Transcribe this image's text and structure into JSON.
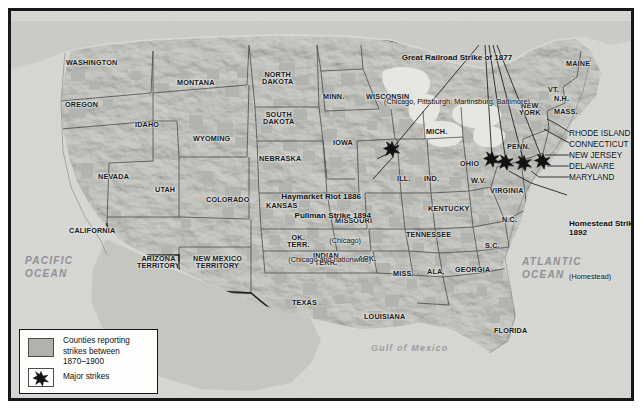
{
  "map": {
    "title_hidden": "",
    "background_color": "#d8d8d4",
    "county_shade_color": "#b0b2ae",
    "border_color": "#16181a",
    "ocean_label_color": "#8e9196"
  },
  "water_labels": [
    {
      "name": "pacific-ocean",
      "text": "PACIFIC\nOCEAN",
      "x": 22,
      "y": 252
    },
    {
      "name": "atlantic-ocean",
      "text": "ATLANTIC\nOCEAN",
      "x": 519,
      "y": 253
    },
    {
      "name": "gulf-of-mexico",
      "text": "Gulf of Mexico",
      "x": 368,
      "y": 340
    }
  ],
  "states": [
    {
      "name": "washington",
      "text": "WASHINGTON",
      "x": 63,
      "y": 56
    },
    {
      "name": "oregon",
      "text": "OREGON",
      "x": 62,
      "y": 98
    },
    {
      "name": "idaho",
      "text": "IDAHO",
      "x": 132,
      "y": 118
    },
    {
      "name": "montana",
      "text": "MONTANA",
      "x": 174,
      "y": 76
    },
    {
      "name": "wyoming",
      "text": "WYOMING",
      "x": 190,
      "y": 132
    },
    {
      "name": "nevada",
      "text": "NEVADA",
      "x": 95,
      "y": 170
    },
    {
      "name": "utah",
      "text": "UTAH",
      "x": 152,
      "y": 183
    },
    {
      "name": "colorado",
      "text": "COLORADO",
      "x": 203,
      "y": 193
    },
    {
      "name": "california",
      "text": "CALIFORNIA",
      "x": 66,
      "y": 224
    },
    {
      "name": "arizona-territory",
      "text": "ARIZONA\nTERRITORY",
      "x": 134,
      "y": 252
    },
    {
      "name": "new-mexico-territory",
      "text": "NEW MEXICO\nTERRITORY",
      "x": 190,
      "y": 252
    },
    {
      "name": "north-dakota",
      "text": "NORTH\nDAKOTA",
      "x": 259,
      "y": 68
    },
    {
      "name": "south-dakota",
      "text": "SOUTH\nDAKOTA",
      "x": 260,
      "y": 108
    },
    {
      "name": "nebraska",
      "text": "NEBRASKA",
      "x": 256,
      "y": 152
    },
    {
      "name": "kansas",
      "text": "KANSAS",
      "x": 263,
      "y": 199
    },
    {
      "name": "oklahoma-territory",
      "text": "OK.\nTERR.",
      "x": 284,
      "y": 231
    },
    {
      "name": "indian-territory",
      "text": "INDIAN\nTERR.",
      "x": 310,
      "y": 249
    },
    {
      "name": "texas",
      "text": "TEXAS",
      "x": 289,
      "y": 296
    },
    {
      "name": "minnesota",
      "text": "MINN.",
      "x": 320,
      "y": 90
    },
    {
      "name": "iowa",
      "text": "IOWA",
      "x": 330,
      "y": 136
    },
    {
      "name": "missouri",
      "text": "MISSOURI",
      "x": 332,
      "y": 214
    },
    {
      "name": "arkansas",
      "text": "ARK.",
      "x": 355,
      "y": 252
    },
    {
      "name": "louisiana",
      "text": "LOUISIANA",
      "x": 361,
      "y": 310
    },
    {
      "name": "wisconsin",
      "text": "WISCONSIN",
      "x": 363,
      "y": 90
    },
    {
      "name": "illinois",
      "text": "ILL.",
      "x": 394,
      "y": 172
    },
    {
      "name": "michigan",
      "text": "MICH.",
      "x": 423,
      "y": 125
    },
    {
      "name": "indiana",
      "text": "IND.",
      "x": 421,
      "y": 172
    },
    {
      "name": "ohio",
      "text": "OHIO",
      "x": 457,
      "y": 157
    },
    {
      "name": "kentucky",
      "text": "KENTUCKY",
      "x": 425,
      "y": 202
    },
    {
      "name": "tennessee",
      "text": "TENNESSEE",
      "x": 403,
      "y": 228
    },
    {
      "name": "mississippi",
      "text": "MISS.",
      "x": 390,
      "y": 267
    },
    {
      "name": "alabama",
      "text": "ALA.",
      "x": 424,
      "y": 265
    },
    {
      "name": "georgia",
      "text": "GEORGIA",
      "x": 452,
      "y": 263
    },
    {
      "name": "south-carolina",
      "text": "S.C.",
      "x": 482,
      "y": 239
    },
    {
      "name": "north-carolina",
      "text": "N.C.",
      "x": 499,
      "y": 213
    },
    {
      "name": "virginia",
      "text": "VIRGINIA",
      "x": 487,
      "y": 184
    },
    {
      "name": "west-virginia",
      "text": "W.V.",
      "x": 468,
      "y": 174
    },
    {
      "name": "florida",
      "text": "FLORIDA",
      "x": 491,
      "y": 324
    },
    {
      "name": "pennsylvania",
      "text": "PENN.",
      "x": 504,
      "y": 140
    },
    {
      "name": "new-york",
      "text": "NEW\nYORK",
      "x": 516,
      "y": 99
    },
    {
      "name": "vermont",
      "text": "VT.",
      "x": 545,
      "y": 83
    },
    {
      "name": "new-hampshire",
      "text": "N.H.",
      "x": 551,
      "y": 92
    },
    {
      "name": "massachusetts",
      "text": "MASS.",
      "x": 551,
      "y": 105
    },
    {
      "name": "maine",
      "text": "MAINE",
      "x": 563,
      "y": 57
    }
  ],
  "northeast_callouts": [
    {
      "name": "rhode-island",
      "text": "RHODE ISLAND",
      "x": 566,
      "y": 126
    },
    {
      "name": "connecticut",
      "text": "CONNECTICUT",
      "x": 566,
      "y": 136
    },
    {
      "name": "new-jersey",
      "text": "NEW JERSEY",
      "x": 566,
      "y": 147
    },
    {
      "name": "delaware",
      "text": "DELAWARE",
      "x": 566,
      "y": 158
    },
    {
      "name": "maryland",
      "text": "MARYLAND",
      "x": 566,
      "y": 169
    }
  ],
  "strike_annotations": [
    {
      "name": "great-railroad-strike",
      "title": "Great Railroad Strike of 1877",
      "subtitle": "(Chicago, Pittsburgh, Martinsburg, Baltimore)",
      "x": 388,
      "y": 14,
      "align": "center"
    },
    {
      "name": "haymarket-riot",
      "title": "Haymarket Riot 1886",
      "subtitle": "(Chicago)",
      "x": 311,
      "y": 153,
      "align": "right"
    },
    {
      "name": "pullman-strike",
      "title": "Pullman Strike 1894",
      "subtitle": "(Chicago and nationwide)",
      "x": 303,
      "y": 172,
      "align": "right"
    },
    {
      "name": "homestead-strike",
      "title": "Homestead Strike\n1892",
      "subtitle": "(Homestead)",
      "x": 566,
      "y": 180,
      "align": "left"
    }
  ],
  "major_strike_markers": [
    {
      "name": "strike-marker-chicago",
      "x": 389,
      "y": 146
    },
    {
      "name": "strike-marker-pittsburgh",
      "x": 489,
      "y": 156
    },
    {
      "name": "strike-marker-homestead",
      "x": 503,
      "y": 159
    },
    {
      "name": "strike-marker-martinsburg",
      "x": 521,
      "y": 160
    },
    {
      "name": "strike-marker-baltimore",
      "x": 540,
      "y": 158
    }
  ],
  "legend": {
    "title_hidden": "",
    "shade_label": "Counties reporting\nstrikes between\n1870–1900",
    "star_label": "Major strikes"
  }
}
